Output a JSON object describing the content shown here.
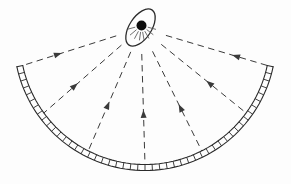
{
  "diagram": {
    "type": "optics-concave-mirror-focus",
    "canvas": {
      "width": 291,
      "height": 184
    },
    "colors": {
      "background": "#fdfdfd",
      "stroke": "#2b2b2b",
      "ray_stroke": "#3a3a3a",
      "dot_fill": "#0d0d0d",
      "glow_stroke": "#4a4a4a"
    },
    "mirror": {
      "cx": 145,
      "cy": 39.5,
      "outer_radius": 131,
      "inner_radius": 125,
      "start_angle_deg": 12,
      "end_angle_deg": 168,
      "segment_count": 48,
      "stroke_width": 1.1
    },
    "focus": {
      "x": 141,
      "y": 28
    },
    "rays": {
      "arc_angles_deg": [
        168,
        144,
        117,
        90,
        63,
        36,
        12
      ],
      "arrow_distances": [
        83,
        84,
        80,
        82,
        85,
        84,
        95
      ],
      "start_distance": 26,
      "dash_pattern": "6.5 4.5",
      "arrow_length": 8,
      "arrow_half_width": 3,
      "stroke_width": 1
    },
    "source": {
      "ellipse": {
        "cx": 140.5,
        "cy": 27.5,
        "rx": 11,
        "ry": 21,
        "rotate_deg": 33,
        "stroke_width": 1.3
      },
      "dot": {
        "cx": 141.5,
        "cy": 25.5,
        "r": 5
      },
      "glow": {
        "angles_deg": [
          165,
          140,
          118,
          98,
          80,
          60,
          38,
          15
        ],
        "r_inner": 6.5,
        "r_outer": 15,
        "stroke_width": 0.8
      }
    }
  }
}
